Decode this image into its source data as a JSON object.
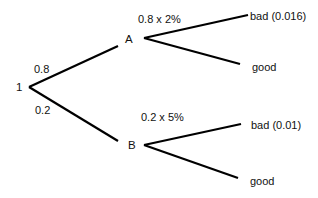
{
  "diagram": {
    "type": "probability-tree",
    "root": {
      "label": "1"
    },
    "branches": [
      {
        "probability": "0.8",
        "node": "A",
        "sub_label": "0.8 x 2%",
        "outcomes": [
          {
            "label": "bad (0.016)"
          },
          {
            "label": "good"
          }
        ]
      },
      {
        "probability": "0.2",
        "node": "B",
        "sub_label": "0.2 x 5%",
        "outcomes": [
          {
            "label": "bad (0.01)"
          },
          {
            "label": "good"
          }
        ]
      }
    ],
    "line_color": "#000000",
    "text_color": "#111111"
  }
}
